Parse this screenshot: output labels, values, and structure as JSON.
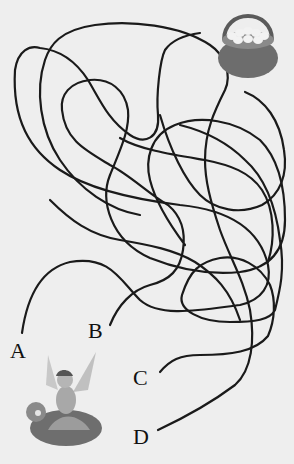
{
  "puzzle": {
    "type": "maze",
    "start_labels": [
      {
        "id": "A",
        "label": "A"
      },
      {
        "id": "B",
        "label": "B"
      },
      {
        "id": "C",
        "label": "C"
      },
      {
        "id": "D",
        "label": "D"
      }
    ],
    "goal": "egg-basket",
    "character": "fairy",
    "colors": {
      "background": "#eeeeee",
      "line": "#1a1a1a",
      "basket": "#6a6a6a",
      "eggs": "#f2f2f2"
    }
  }
}
